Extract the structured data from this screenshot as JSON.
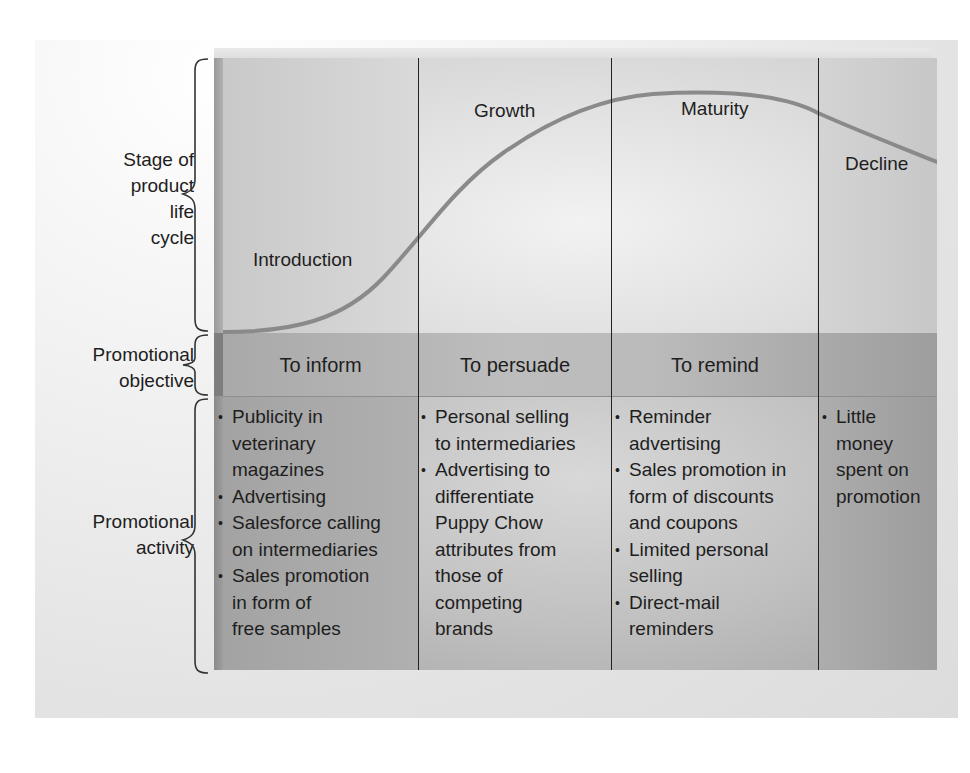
{
  "row_labels": {
    "stage": [
      "Stage of",
      "product",
      "life",
      "cycle"
    ],
    "objective": [
      "Promotional",
      "objective"
    ],
    "activity": [
      "Promotional",
      "activity"
    ]
  },
  "stages": [
    {
      "name": "Introduction",
      "objective": "To inform",
      "activities": [
        "Publicity in veterinary magazines",
        "Advertising",
        "Salesforce calling on intermediaries",
        "Sales promotion in form of free samples"
      ]
    },
    {
      "name": "Growth",
      "objective": "To persuade",
      "activities": [
        "Personal selling to intermediaries",
        "Advertising to differentiate Puppy Chow attributes from those of competing brands"
      ]
    },
    {
      "name": "Maturity",
      "objective": "To remind",
      "activities": [
        "Reminder advertising",
        "Sales promotion in form of discounts and coupons",
        "Limited personal selling",
        "Direct-mail reminders"
      ]
    },
    {
      "name": "Decline",
      "objective": "",
      "activities": [
        "Little money spent on promotion"
      ]
    }
  ],
  "display_lines": {
    "col0": [
      [
        "Publicity in",
        "veterinary",
        "magazines"
      ],
      [
        "Advertising"
      ],
      [
        "Salesforce calling",
        "on intermediaries"
      ],
      [
        "Sales promotion",
        "in form of",
        "free samples"
      ]
    ],
    "col1": [
      [
        "Personal selling",
        "to intermediaries"
      ],
      [
        "Advertising to",
        "differentiate",
        "Puppy Chow",
        "attributes from",
        "those of",
        "competing",
        "brands"
      ]
    ],
    "col2": [
      [
        "Reminder",
        "advertising"
      ],
      [
        "Sales promotion in",
        "form of discounts",
        "and coupons"
      ],
      [
        "Limited personal",
        "selling"
      ],
      [
        "Direct-mail",
        "reminders"
      ]
    ],
    "col3": [
      [
        "Little",
        "money",
        "spent on",
        "promotion"
      ]
    ]
  },
  "colors": {
    "curve": "#8a8a8a",
    "divider": "#222222",
    "text": "#1e1e1e"
  }
}
